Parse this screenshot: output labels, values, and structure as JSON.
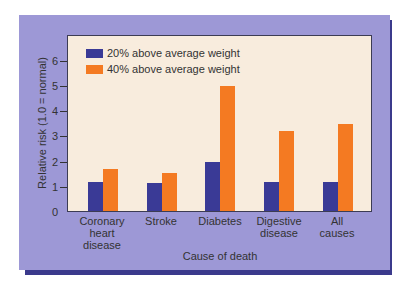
{
  "colors": {
    "series1": "#3a3a96",
    "series2": "#f47a22",
    "panel": "#9d98d6",
    "plot_bg": "#f8ecdd",
    "shadow": "#3b3a8c"
  },
  "legend": [
    {
      "label": "20% above average weight"
    },
    {
      "label": "40% above average weight"
    }
  ],
  "axes": {
    "ylabel": "Relative risk (1.0 = normal)",
    "xlabel": "Cause of death",
    "yticks": [
      "0",
      "1",
      "2",
      "3",
      "4",
      "5",
      "6"
    ]
  },
  "categories": [
    {
      "line1": "Coronary",
      "line2": "heart",
      "line3": "disease"
    },
    {
      "line1": "Stroke",
      "line2": "",
      "line3": ""
    },
    {
      "line1": "Diabetes",
      "line2": "",
      "line3": ""
    },
    {
      "line1": "Digestive",
      "line2": "disease",
      "line3": ""
    },
    {
      "line1": "All",
      "line2": "causes",
      "line3": ""
    }
  ],
  "chart_data": {
    "type": "bar",
    "title": "",
    "categories": [
      "Coronary heart disease",
      "Stroke",
      "Diabetes",
      "Digestive disease",
      "All causes"
    ],
    "series": [
      {
        "name": "20% above average weight",
        "values": [
          1.2,
          1.15,
          2.0,
          1.2,
          1.2
        ]
      },
      {
        "name": "40% above average weight",
        "values": [
          1.7,
          1.55,
          5.0,
          3.2,
          3.5
        ]
      }
    ],
    "xlabel": "Cause of death",
    "ylabel": "Relative risk (1.0 = normal)",
    "ylim": [
      0,
      6.8
    ],
    "yticks": [
      0,
      1,
      2,
      3,
      4,
      5,
      6
    ],
    "grid": false,
    "legend_position": "upper left"
  }
}
